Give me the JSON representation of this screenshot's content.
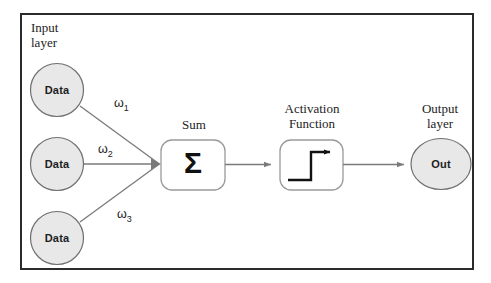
{
  "diagram": {
    "frame": {
      "border_color": "#2b2b2b",
      "background": "#ffffff"
    },
    "palette": {
      "node_fill": "#e8e8e8",
      "node_stroke": "#6f6f6f",
      "box_stroke": "#9a9a9a",
      "arrow_color": "#7a7a7a",
      "glyph_color": "#111111",
      "text_color": "#1d1d1d",
      "page_background": "#ffffff"
    },
    "labels": {
      "input_layer": "Input\nlayer",
      "sum": "Sum",
      "activation": "Activation\nFunction",
      "output_layer": "Output\nlayer"
    },
    "input_nodes": [
      {
        "label": "Data",
        "cx": 57,
        "cy": 90
      },
      {
        "label": "Data",
        "cx": 57,
        "cy": 164
      },
      {
        "label": "Data",
        "cx": 57,
        "cy": 238
      }
    ],
    "weights": [
      {
        "label": "ω",
        "sub": "1",
        "x": 114,
        "y": 96
      },
      {
        "label": "ω",
        "sub": "2",
        "x": 98,
        "y": 142
      },
      {
        "label": "ω",
        "sub": "3",
        "x": 117,
        "y": 207
      }
    ],
    "sum_node": {
      "symbol": "Σ",
      "x": 161,
      "y": 140,
      "width": 64,
      "height": 50
    },
    "activation_node": {
      "glyph": "step-function",
      "x": 280,
      "y": 140,
      "width": 63,
      "height": 50
    },
    "output_node": {
      "label": "Out",
      "cx": 441,
      "cy": 164,
      "rx": 30,
      "ry": 25
    },
    "connections": [
      {
        "from": "data-1",
        "to": "sum"
      },
      {
        "from": "data-2",
        "to": "sum"
      },
      {
        "from": "data-3",
        "to": "sum"
      },
      {
        "from": "sum",
        "to": "activation"
      },
      {
        "from": "activation",
        "to": "output"
      }
    ]
  }
}
